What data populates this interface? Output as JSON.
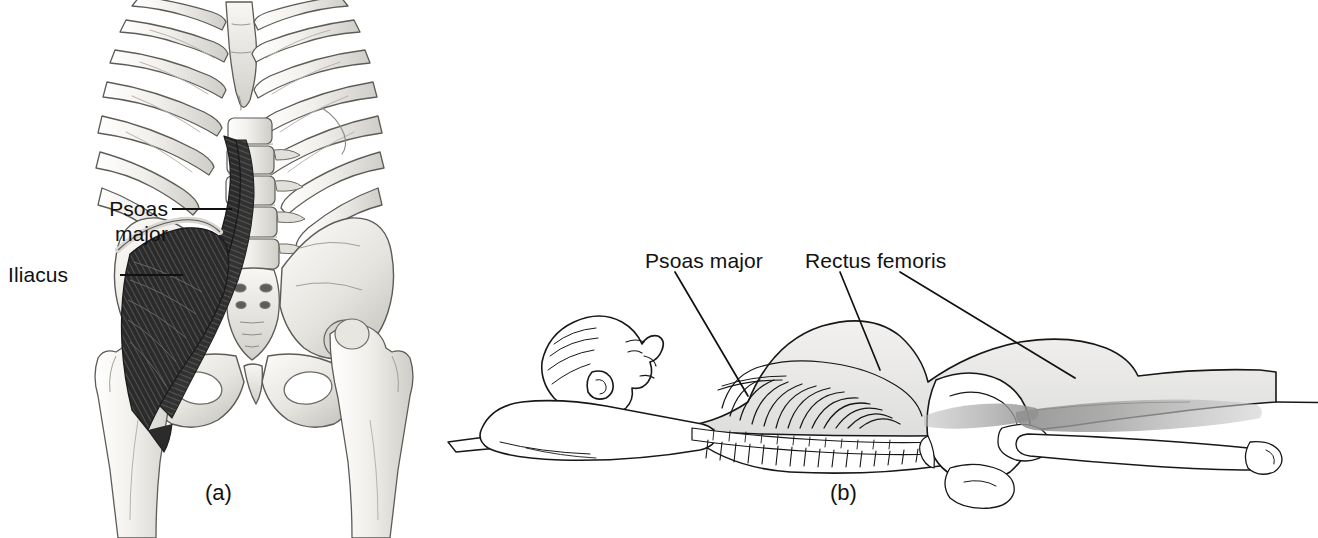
{
  "figure": {
    "type": "anatomical-illustration",
    "background_color": "#ffffff",
    "line_color": "#111111",
    "muscle_dark_color": "#2e2e2e",
    "bone_fill_color": "#eceae6",
    "shade_color": "#b9b9b9"
  },
  "panel_a": {
    "caption": "(a)",
    "view": "anterior view of lumbar spine, pelvis and femurs with iliopsoas highlighted",
    "labels": [
      {
        "id": "psoas-major",
        "line1": "Psoas",
        "line2": "major",
        "text": "Psoas major"
      },
      {
        "id": "iliacus",
        "line1": "Iliacus",
        "text": "Iliacus"
      }
    ]
  },
  "panel_b": {
    "caption": "(b)",
    "view": "lateral view of supine person showing line of pull of hip flexors",
    "labels": [
      {
        "id": "psoas-major",
        "text": "Psoas major"
      },
      {
        "id": "rectus-femoris",
        "text": "Rectus femoris"
      }
    ]
  }
}
